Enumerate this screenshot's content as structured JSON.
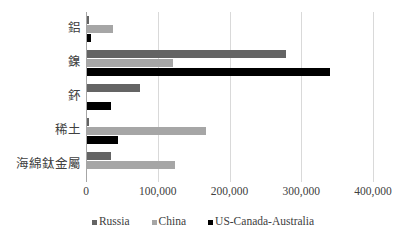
{
  "chart_data": {
    "type": "bar",
    "orientation": "horizontal",
    "title": "",
    "xlabel": "",
    "ylabel": "",
    "xlim": [
      0,
      400000
    ],
    "grid": true,
    "legend_position": "bottom",
    "categories": [
      "鋁",
      "鎳",
      "鈈",
      "稀土",
      "海綿鈦金屬"
    ],
    "tick_labels": [
      "0",
      "100,000",
      "200,000",
      "300,000",
      "400,000"
    ],
    "tick_values": [
      0,
      100000,
      200000,
      300000,
      400000
    ],
    "series": [
      {
        "name": "Russia",
        "color": "#646464",
        "values": [
          2500,
          278000,
          74000,
          2700,
          33000
        ]
      },
      {
        "name": "China",
        "color": "#a6a6a6",
        "values": [
          36000,
          120000,
          0,
          166000,
          122000
        ]
      },
      {
        "name": "US-Canada-Australia",
        "color": "#000000",
        "values": [
          5000,
          338000,
          33000,
          43000,
          0
        ]
      }
    ]
  },
  "legend": {
    "items": [
      {
        "label": "Russia",
        "color": "#646464"
      },
      {
        "label": "China",
        "color": "#a6a6a6"
      },
      {
        "label": "US-Canada-Australia",
        "color": "#000000"
      }
    ]
  }
}
